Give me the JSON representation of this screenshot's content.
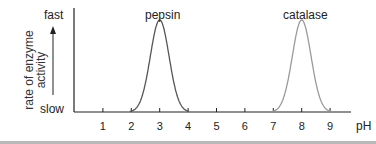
{
  "chart_data": {
    "type": "line",
    "title": "",
    "xlabel": "pH",
    "ylabel": "rate of enzyme activity",
    "y_top_label": "fast",
    "y_bottom_label": "slow",
    "x_ticks": [
      1,
      2,
      3,
      4,
      5,
      6,
      7,
      8,
      9
    ],
    "xlim": [
      0,
      9.8
    ],
    "ylim": [
      0,
      1
    ],
    "grid": false,
    "legend": "none",
    "series": [
      {
        "name": "pepsin",
        "color": "#555555",
        "peak_x": 3,
        "range": [
          2,
          4
        ],
        "peak_y": 1.0,
        "points": [
          [
            2,
            0
          ],
          [
            2.5,
            0.3
          ],
          [
            3,
            1.0
          ],
          [
            3.5,
            0.3
          ],
          [
            4,
            0
          ]
        ]
      },
      {
        "name": "catalase",
        "color": "#9a9a9a",
        "peak_x": 8,
        "range": [
          7,
          9
        ],
        "peak_y": 1.0,
        "points": [
          [
            7,
            0
          ],
          [
            7.5,
            0.3
          ],
          [
            8,
            1.0
          ],
          [
            8.5,
            0.3
          ],
          [
            9,
            0
          ]
        ]
      }
    ]
  }
}
